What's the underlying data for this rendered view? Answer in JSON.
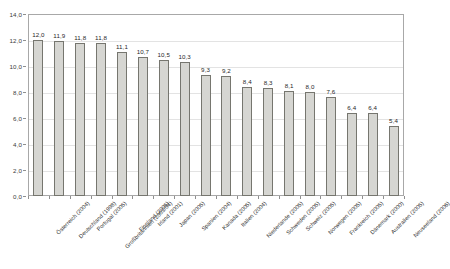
{
  "chart_data": {
    "type": "bar",
    "title": "",
    "subtitle": "",
    "xlabel": "",
    "ylabel": "",
    "ylim": [
      0.0,
      14.0
    ],
    "ytick_step": 2.0,
    "grid": true,
    "legend": null,
    "orientation": "vertical",
    "value_label_format": "comma-decimal",
    "axis_tick_labels": [
      "0,0",
      "2,0",
      "4,0",
      "6,0",
      "8,0",
      "10,0",
      "12,0",
      "14,0"
    ],
    "axis_tick_values": [
      0.0,
      2.0,
      4.0,
      6.0,
      8.0,
      10.0,
      12.0,
      14.0
    ],
    "categories": [
      "Österreich (2004)",
      "Deutschland (1998)",
      "Portugal (2005)",
      "Großbritannien (2003/04)",
      "Finnland (2005)",
      "Irland (2001)",
      "Japan (2005)",
      "Spanien (2004)",
      "Kanada (2005)",
      "Italien (2004)",
      "Niederlande (2005)",
      "Schweden (2005)",
      "Schweiz (2005)",
      "Norwegen (2005)",
      "Frankreich (2005)",
      "Dänemark (2000)",
      "Australien (2005)",
      "Neuseeland (2006)"
    ],
    "values": [
      12.0,
      11.9,
      11.8,
      11.8,
      11.1,
      10.7,
      10.5,
      10.3,
      9.3,
      9.2,
      8.4,
      8.3,
      8.1,
      8.0,
      7.6,
      6.4,
      6.4,
      5.4
    ],
    "value_labels": [
      "12,0",
      "11,9",
      "11,8",
      "11,8",
      "11,1",
      "10,7",
      "10,5",
      "10,3",
      "9,3",
      "9,2",
      "8,4",
      "8,3",
      "8,1",
      "8,0",
      "7,6",
      "6,4",
      "6,4",
      "5,4"
    ],
    "colors": {
      "bar_fill": "#d6d6d2",
      "bar_border": "#76766f",
      "gridline": "#e3e3e3",
      "axis": "#a8a8a8",
      "text": "#2b2b2b",
      "background": "#ffffff"
    }
  }
}
